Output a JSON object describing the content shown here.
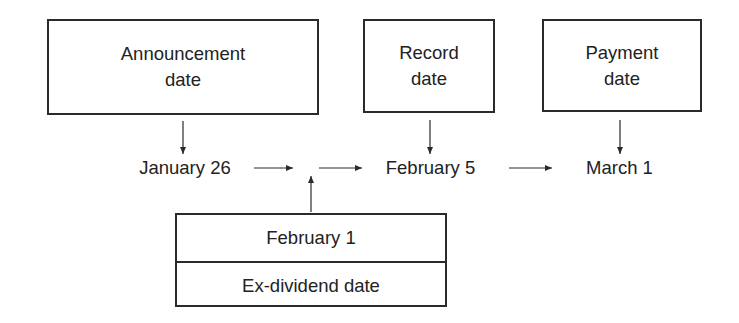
{
  "diagram": {
    "boxes": {
      "announcement": {
        "line1": "Announcement",
        "line2": "date"
      },
      "record": {
        "line1": "Record",
        "line2": "date"
      },
      "payment": {
        "line1": "Payment",
        "line2": "date"
      }
    },
    "timeline": {
      "announcement_date": "January 26",
      "record_date": "February 5",
      "payment_date": "March 1"
    },
    "ex_dividend": {
      "date": "February 1",
      "label": "Ex-dividend date"
    },
    "colors": {
      "line": "#2a2a2a",
      "text": "#222222",
      "background": "#ffffff"
    }
  }
}
